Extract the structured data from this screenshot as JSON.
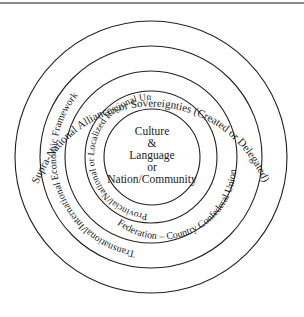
{
  "diagram": {
    "type": "concentric-circles",
    "center": {
      "lines": [
        "Culture",
        "&",
        "Language",
        "or",
        "Nation/Community"
      ]
    },
    "rings": [
      {
        "level": 1,
        "label": "Provincial/National or Localized Regional Unit"
      },
      {
        "level": 2,
        "label": "Federation – Country Confederal Union"
      },
      {
        "level": 3,
        "label": "Transnational/International Economic Framework"
      },
      {
        "level": 4,
        "label": "Supra-National Alliances or Sovereignties (Created or Delegated)"
      }
    ],
    "colors": {
      "stroke": "#222222",
      "text": "#222222",
      "background": "#ffffff",
      "top_border": "#8a8a8a"
    }
  }
}
